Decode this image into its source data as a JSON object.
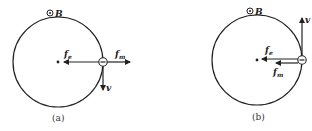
{
  "figure": {
    "field_label": "B",
    "field_symbol": "⊙",
    "panels": [
      {
        "caption": "(a)",
        "charge_symbol": "−",
        "labels": {
          "f_e": "f",
          "f_e_sub": "e",
          "f_m": "f",
          "f_m_sub": "m",
          "v": "v"
        }
      },
      {
        "caption": "(b)",
        "charge_symbol": "−",
        "labels": {
          "f_e": "f",
          "f_e_sub": "e",
          "f_m": "f",
          "f_m_sub": "m",
          "v": "v"
        }
      }
    ]
  },
  "colors": {
    "stroke": "#222222",
    "background": "#ffffff"
  }
}
